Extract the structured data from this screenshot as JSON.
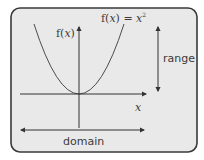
{
  "diagram": {
    "colors": {
      "background": "#ffffff",
      "panel_fill": "#e9e9e9",
      "panel_border": "#3a3a3a",
      "line": "#333333",
      "text": "#3a3a3a"
    },
    "labels": {
      "y_axis": "f(",
      "y_axis_var": "x",
      "y_axis_close": ")",
      "function_prefix": "f(",
      "function_var": "x",
      "function_mid": ") = ",
      "function_base": "x",
      "function_exp": "2",
      "x_axis": "x",
      "range": "range",
      "domain": "domain"
    },
    "elements": {
      "curve": "parabola",
      "vertex": [
        0,
        0
      ],
      "axes": [
        "x",
        "f(x)"
      ],
      "range_arrow": "vertical double-headed arrow",
      "domain_arrow": "horizontal double-headed arrow"
    }
  }
}
